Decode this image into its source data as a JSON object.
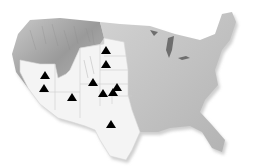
{
  "map": {
    "region": "Contiguous United States",
    "style": "shaded relief, grayscale",
    "highlight_color": "#f4f4f4",
    "relief_color": "#b8b8b8",
    "marker_color": "#000000",
    "marker_shape": "triangle",
    "highlighted_regions": [
      "Southwest",
      "Great Plains"
    ],
    "markers": [
      {
        "id": 1,
        "x": 106,
        "y": 50
      },
      {
        "id": 2,
        "x": 106,
        "y": 64
      },
      {
        "id": 3,
        "x": 45,
        "y": 75
      },
      {
        "id": 4,
        "x": 44,
        "y": 88
      },
      {
        "id": 5,
        "x": 93,
        "y": 82
      },
      {
        "id": 6,
        "x": 72,
        "y": 97
      },
      {
        "id": 7,
        "x": 103,
        "y": 93
      },
      {
        "id": 8,
        "x": 113,
        "y": 92
      },
      {
        "id": 9,
        "x": 117,
        "y": 87
      },
      {
        "id": 10,
        "x": 111,
        "y": 124
      }
    ]
  }
}
